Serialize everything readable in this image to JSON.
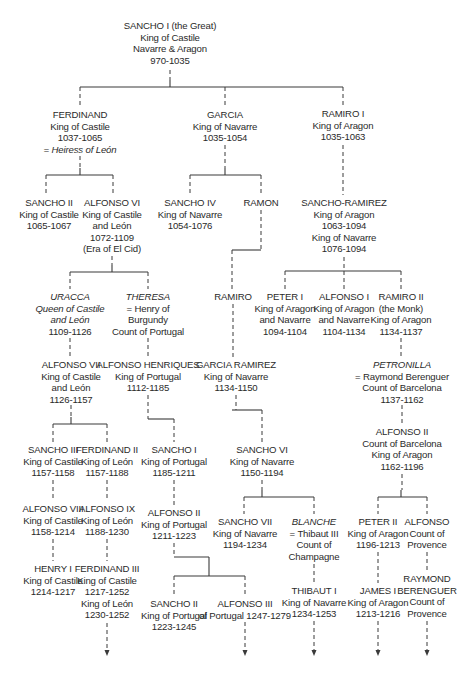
{
  "diagram": {
    "type": "family-tree",
    "line_color": "#3a3a3a",
    "nodes": [
      {
        "id": "sancho1",
        "x": 170,
        "y": 20,
        "lines": [
          {
            "t": "SANCHO I (the Great)"
          },
          {
            "t": "King of Castile"
          },
          {
            "t": "Navarre & Aragon"
          },
          {
            "t": "970-1035"
          }
        ]
      },
      {
        "id": "ferdinand",
        "x": 80,
        "y": 109,
        "lines": [
          {
            "t": "FERDINAND"
          },
          {
            "t": "King of Castile"
          },
          {
            "t": "1037-1065"
          },
          {
            "t": "= Heiress of León",
            "i": true
          }
        ]
      },
      {
        "id": "garcia",
        "x": 225,
        "y": 109,
        "lines": [
          {
            "t": "GARCIA"
          },
          {
            "t": "King of Navarre"
          },
          {
            "t": "1035-1054"
          }
        ]
      },
      {
        "id": "ramiro1",
        "x": 343,
        "y": 108,
        "lines": [
          {
            "t": "RAMIRO I"
          },
          {
            "t": "King of Aragon"
          },
          {
            "t": "1035-1063"
          }
        ]
      },
      {
        "id": "sancho2",
        "x": 49,
        "y": 197,
        "lines": [
          {
            "t": "SANCHO II"
          },
          {
            "t": "King of Castile"
          },
          {
            "t": "1065-1067"
          }
        ]
      },
      {
        "id": "alfonso6",
        "x": 112,
        "y": 197,
        "lines": [
          {
            "t": "ALFONSO VI"
          },
          {
            "t": "King of Castile"
          },
          {
            "t": "and León"
          },
          {
            "t": "1072-1109"
          },
          {
            "t": "(Era of El Cid)"
          }
        ]
      },
      {
        "id": "sancho4",
        "x": 190,
        "y": 197,
        "lines": [
          {
            "t": "SANCHO IV"
          },
          {
            "t": "King of Navarre"
          },
          {
            "t": "1054-1076"
          }
        ]
      },
      {
        "id": "ramon",
        "x": 261,
        "y": 197,
        "lines": [
          {
            "t": "RAMON"
          }
        ]
      },
      {
        "id": "sanchoramirez",
        "x": 344,
        "y": 197,
        "lines": [
          {
            "t": "SANCHO-RAMIREZ"
          },
          {
            "t": "King of Aragon"
          },
          {
            "t": "1063-1094"
          },
          {
            "t": "King of Navarre"
          },
          {
            "t": "1076-1094"
          }
        ]
      },
      {
        "id": "uracca",
        "x": 70,
        "y": 291,
        "lines": [
          {
            "t": "URACCA",
            "i": true
          },
          {
            "t": "Queen of Castile",
            "i": true
          },
          {
            "t": "and León",
            "i": true
          },
          {
            "t": "1109-1126"
          }
        ]
      },
      {
        "id": "theresa",
        "x": 148,
        "y": 291,
        "lines": [
          {
            "t": "THERESA",
            "i": true
          },
          {
            "t": "= Henry of"
          },
          {
            "t": "Burgundy"
          },
          {
            "t": "Count of Portugal"
          }
        ]
      },
      {
        "id": "ramiro",
        "x": 233,
        "y": 291,
        "lines": [
          {
            "t": "RAMIRO"
          }
        ]
      },
      {
        "id": "peter1",
        "x": 285,
        "y": 291,
        "lines": [
          {
            "t": "PETER I"
          },
          {
            "t": "King of Aragon"
          },
          {
            "t": "and Navarre"
          },
          {
            "t": "1094-1104"
          }
        ]
      },
      {
        "id": "alfonso1",
        "x": 344,
        "y": 291,
        "lines": [
          {
            "t": "ALFONSO I"
          },
          {
            "t": "King of Aragon"
          },
          {
            "t": "and Navarre"
          },
          {
            "t": "1104-1134"
          }
        ]
      },
      {
        "id": "ramiro2",
        "x": 401,
        "y": 291,
        "lines": [
          {
            "t": "RAMIRO II"
          },
          {
            "t": "(the Monk)"
          },
          {
            "t": "King of Aragon"
          },
          {
            "t": "1134-1137"
          }
        ]
      },
      {
        "id": "alfonso7",
        "x": 71,
        "y": 359,
        "lines": [
          {
            "t": "ALFONSO VII"
          },
          {
            "t": "King of Castile"
          },
          {
            "t": "and León"
          },
          {
            "t": "1126-1157"
          }
        ]
      },
      {
        "id": "alfonsohenriques",
        "x": 148,
        "y": 359,
        "lines": [
          {
            "t": "ALFONSO HENRIQUES"
          },
          {
            "t": "King of Portugal"
          },
          {
            "t": "1112-1185"
          }
        ]
      },
      {
        "id": "garciaramirez",
        "x": 236,
        "y": 359,
        "lines": [
          {
            "t": "GARCIA RAMIREZ"
          },
          {
            "t": "King of Navarre"
          },
          {
            "t": "1134-1150"
          }
        ]
      },
      {
        "id": "petronilla",
        "x": 402,
        "y": 359,
        "lines": [
          {
            "t": "PETRONILLA",
            "i": true
          },
          {
            "t": "= Raymond Berenguer"
          },
          {
            "t": "Count of Barcelona"
          },
          {
            "t": "1137-1162"
          }
        ]
      },
      {
        "id": "alfonso2barcelona",
        "x": 402,
        "y": 426,
        "lines": [
          {
            "t": "ALFONSO II"
          },
          {
            "t": "Count of Barcelona"
          },
          {
            "t": "King of Aragon"
          },
          {
            "t": "1162-1196"
          }
        ]
      },
      {
        "id": "sancho3",
        "x": 53,
        "y": 444,
        "lines": [
          {
            "t": "SANCHO III"
          },
          {
            "t": "King of Castile"
          },
          {
            "t": "1157-1158"
          }
        ]
      },
      {
        "id": "ferdinand2",
        "x": 107,
        "y": 444,
        "lines": [
          {
            "t": "FERDINAND II"
          },
          {
            "t": "King of León"
          },
          {
            "t": "1157-1188"
          }
        ]
      },
      {
        "id": "sancho1portugal",
        "x": 174,
        "y": 444,
        "lines": [
          {
            "t": "SANCHO I"
          },
          {
            "t": "King of Portugal"
          },
          {
            "t": "1185-1211"
          }
        ]
      },
      {
        "id": "sancho6",
        "x": 262,
        "y": 444,
        "lines": [
          {
            "t": "SANCHO VI"
          },
          {
            "t": "King of Navarre"
          },
          {
            "t": "1150-1194"
          }
        ]
      },
      {
        "id": "alfonso8",
        "x": 53,
        "y": 503,
        "lines": [
          {
            "t": "ALFONSO VIII"
          },
          {
            "t": "King of Castile"
          },
          {
            "t": "1158-1214"
          }
        ]
      },
      {
        "id": "alfonso9",
        "x": 107,
        "y": 503,
        "lines": [
          {
            "t": "ALFONSO IX"
          },
          {
            "t": "King of León"
          },
          {
            "t": "1188-1230"
          }
        ]
      },
      {
        "id": "alfonso2portugal",
        "x": 174,
        "y": 507,
        "lines": [
          {
            "t": "ALFONSO II"
          },
          {
            "t": "King of Portugal"
          },
          {
            "t": "1211-1223"
          }
        ]
      },
      {
        "id": "sancho7",
        "x": 245,
        "y": 516,
        "lines": [
          {
            "t": "SANCHO VII"
          },
          {
            "t": "King of Navarre"
          },
          {
            "t": "1194-1234"
          }
        ]
      },
      {
        "id": "blanche",
        "x": 314,
        "y": 516,
        "lines": [
          {
            "t": "BLANCHE",
            "i": true
          },
          {
            "t": "= Thibaut III"
          },
          {
            "t": "Count of"
          },
          {
            "t": "Champagne"
          }
        ]
      },
      {
        "id": "peter2",
        "x": 378,
        "y": 516,
        "lines": [
          {
            "t": "PETER II"
          },
          {
            "t": "King of Aragon"
          },
          {
            "t": "1196-1213"
          }
        ]
      },
      {
        "id": "alfonsoprovence",
        "x": 427,
        "y": 516,
        "lines": [
          {
            "t": "ALFONSO"
          },
          {
            "t": "Count of"
          },
          {
            "t": "Provence"
          }
        ]
      },
      {
        "id": "henry1",
        "x": 53,
        "y": 563,
        "lines": [
          {
            "t": "HENRY I"
          },
          {
            "t": "King of Castile"
          },
          {
            "t": "1214-1217"
          }
        ]
      },
      {
        "id": "ferdinand3",
        "x": 107,
        "y": 563,
        "lines": [
          {
            "t": "FERDINAND III"
          },
          {
            "t": "King of Castile"
          },
          {
            "t": "1217-1252"
          },
          {
            "t": "King of León"
          },
          {
            "t": "1230-1252"
          }
        ]
      },
      {
        "id": "sancho2portugal",
        "x": 174,
        "y": 598,
        "lines": [
          {
            "t": "SANCHO II"
          },
          {
            "t": "King of Portugal"
          },
          {
            "t": "1223-1245"
          }
        ]
      },
      {
        "id": "alfonso3",
        "x": 245,
        "y": 598,
        "lines": [
          {
            "t": "ALFONSO III"
          },
          {
            "t": "of Portugal 1247-1279"
          }
        ]
      },
      {
        "id": "thibaut1",
        "x": 314,
        "y": 585,
        "lines": [
          {
            "t": "THIBAUT I"
          },
          {
            "t": "King of Navarre"
          },
          {
            "t": "1234-1253"
          }
        ]
      },
      {
        "id": "james1",
        "x": 378,
        "y": 585,
        "lines": [
          {
            "t": "JAMES I"
          },
          {
            "t": "King of Aragon"
          },
          {
            "t": "1213-1216"
          }
        ]
      },
      {
        "id": "raymondberenguer",
        "x": 427,
        "y": 573,
        "lines": [
          {
            "t": "RAYMOND"
          },
          {
            "t": "BERENGUER"
          },
          {
            "t": "Count of"
          },
          {
            "t": "Provence"
          }
        ]
      }
    ],
    "solid_lines": [
      [
        80,
        87,
        343,
        87
      ],
      [
        170,
        80,
        170,
        87
      ],
      [
        46,
        175,
        113,
        175
      ],
      [
        80,
        175,
        80,
        168
      ],
      [
        190,
        175,
        261,
        175
      ],
      [
        225,
        175,
        225,
        168
      ],
      [
        70,
        272,
        148,
        272
      ],
      [
        112,
        272,
        112,
        265
      ],
      [
        232,
        250,
        261,
        250
      ],
      [
        285,
        271,
        401,
        271
      ],
      [
        53,
        424,
        107,
        424
      ],
      [
        71,
        424,
        71,
        417
      ],
      [
        148,
        419,
        174,
        419
      ],
      [
        232,
        410,
        262,
        410
      ],
      [
        244,
        497,
        314,
        497
      ],
      [
        262,
        497,
        262,
        490
      ],
      [
        378,
        497,
        427,
        497
      ],
      [
        401,
        497,
        401,
        490
      ],
      [
        174,
        557,
        209,
        557
      ],
      [
        174,
        576,
        245,
        576
      ],
      [
        209,
        557,
        209,
        576
      ]
    ],
    "dashed_lines": [
      [
        170,
        70,
        170,
        80
      ],
      [
        80,
        87,
        80,
        107
      ],
      [
        225,
        87,
        225,
        107
      ],
      [
        343,
        87,
        343,
        106
      ],
      [
        80,
        156,
        80,
        168
      ],
      [
        225,
        145,
        225,
        168
      ],
      [
        343,
        145,
        343,
        195
      ],
      [
        46,
        175,
        46,
        195
      ],
      [
        113,
        175,
        113,
        195
      ],
      [
        190,
        175,
        190,
        195
      ],
      [
        261,
        175,
        261,
        195
      ],
      [
        261,
        210,
        261,
        250
      ],
      [
        232,
        250,
        232,
        289
      ],
      [
        112,
        256,
        112,
        265
      ],
      [
        70,
        272,
        70,
        289
      ],
      [
        148,
        272,
        148,
        289
      ],
      [
        344,
        257,
        344,
        289
      ],
      [
        285,
        271,
        285,
        289
      ],
      [
        401,
        271,
        401,
        289
      ],
      [
        233,
        304,
        233,
        357
      ],
      [
        70,
        338,
        70,
        357
      ],
      [
        148,
        338,
        148,
        357
      ],
      [
        401,
        338,
        401,
        357
      ],
      [
        71,
        405,
        71,
        417
      ],
      [
        148,
        395,
        148,
        419
      ],
      [
        236,
        395,
        236,
        410
      ],
      [
        53,
        424,
        53,
        442
      ],
      [
        107,
        424,
        107,
        442
      ],
      [
        174,
        419,
        174,
        442
      ],
      [
        262,
        410,
        262,
        442
      ],
      [
        402,
        405,
        402,
        424
      ],
      [
        262,
        480,
        262,
        490
      ],
      [
        402,
        474,
        402,
        490
      ],
      [
        244,
        497,
        244,
        514
      ],
      [
        314,
        497,
        314,
        514
      ],
      [
        378,
        497,
        378,
        514
      ],
      [
        427,
        497,
        427,
        514
      ],
      [
        53,
        480,
        53,
        501
      ],
      [
        107,
        480,
        107,
        501
      ],
      [
        174,
        480,
        174,
        505
      ],
      [
        53,
        539,
        53,
        561
      ],
      [
        107,
        539,
        107,
        561
      ],
      [
        174,
        543,
        174,
        557
      ],
      [
        174,
        576,
        174,
        596
      ],
      [
        245,
        576,
        245,
        596
      ],
      [
        314,
        564,
        314,
        583
      ],
      [
        378,
        552,
        378,
        583
      ],
      [
        427,
        552,
        427,
        571
      ],
      [
        107,
        623,
        107,
        650
      ],
      [
        245,
        622,
        245,
        650
      ],
      [
        314,
        621,
        314,
        650
      ],
      [
        378,
        621,
        378,
        650
      ],
      [
        427,
        621,
        427,
        650
      ]
    ],
    "arrows": [
      [
        107,
        650
      ],
      [
        245,
        650
      ],
      [
        314,
        650
      ],
      [
        378,
        650
      ],
      [
        427,
        650
      ]
    ]
  }
}
